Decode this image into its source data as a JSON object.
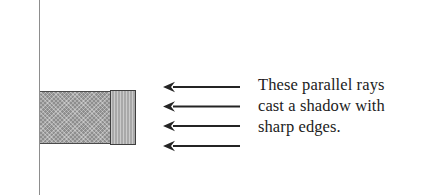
{
  "figure": {
    "name": "sharp-shadow-diagram",
    "background_color": "#ffffff",
    "width": 445,
    "height": 195
  },
  "wall": {
    "name": "wall-line",
    "color": "#8d8d8d",
    "x": 39,
    "top": 0,
    "height": 195
  },
  "shadow": {
    "label": "shadow region",
    "fill_color": "#8e8e8e",
    "border_color": "#4a4a4a",
    "pattern": "cross-hatch",
    "x": 40,
    "y": 91,
    "width": 70,
    "height": 53
  },
  "object": {
    "label": "occluding object",
    "fill_color": "#a9a9a9",
    "border_color": "#3f3f3f",
    "pattern": "vertical-lines",
    "x": 110,
    "y": 90,
    "width": 26,
    "height": 55
  },
  "rays": {
    "label": "parallel light rays",
    "color": "#242424",
    "direction": "left",
    "count": 4,
    "tail_x": 240,
    "head_x": 163,
    "arrows": [
      {
        "y": 87
      },
      {
        "y": 106.5
      },
      {
        "y": 126
      },
      {
        "y": 146
      }
    ]
  },
  "caption": {
    "name": "caption-text",
    "color": "#1c1c1c",
    "lines": [
      "These parallel rays",
      "cast a shadow with",
      "sharp edges."
    ]
  }
}
